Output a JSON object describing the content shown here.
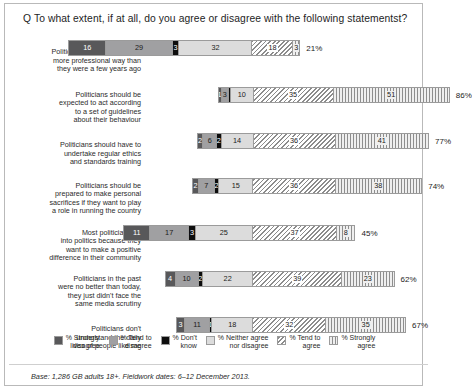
{
  "title": "Q To what extent, if at all, do you agree or disagree with the following statementst?",
  "footer": "Base: 1,286 GB adults 18+. Fieldwork dates: 6–12 December 2013.",
  "legend": [
    {
      "key": "strongly_disagree",
      "label": "% Strongly\ndisagree",
      "color": "#58585a"
    },
    {
      "key": "tend_to_disagree",
      "label": "% Tend to\ndisagree",
      "color": "#a0a0a2"
    },
    {
      "key": "dont_know",
      "label": "% Don't\nknow",
      "color": "#0d0d0d"
    },
    {
      "key": "neither",
      "label": "% Neither agree\nnor disagree",
      "color": "#dcdcdc"
    },
    {
      "key": "tend_to_agree",
      "label": "% Tend to\nagree",
      "color": "#ffffff"
    },
    {
      "key": "strongly_agree",
      "label": "% Strongly\nagree",
      "color": "#efefef"
    }
  ],
  "chart_data": {
    "type": "bar",
    "title": "Q To what extent, if at all, do you agree or disagree with the following statementst?",
    "subtype": "diverging-stacked-bar",
    "xlabel": "",
    "ylabel": "",
    "grid": false,
    "legend_position": "bottom",
    "series": [
      {
        "name": "% Strongly disagree",
        "values": [
          16,
          1,
          2,
          2,
          11,
          4,
          3
        ]
      },
      {
        "name": "% Tend to disagree",
        "values": [
          29,
          3,
          6,
          7,
          17,
          10,
          11
        ]
      },
      {
        "name": "% Don't know",
        "values": [
          3,
          1,
          2,
          2,
          3,
          2,
          1
        ]
      },
      {
        "name": "% Neither agree nor disagree",
        "values": [
          32,
          10,
          14,
          15,
          25,
          22,
          18
        ]
      },
      {
        "name": "% Tend to agree",
        "values": [
          18,
          35,
          36,
          36,
          37,
          39,
          32
        ]
      },
      {
        "name": "% Strongly agree",
        "values": [
          3,
          51,
          41,
          38,
          8,
          23,
          35
        ]
      }
    ],
    "categories": [
      "Politicians are behaving in a more professional way than they were a few years ago",
      "Politicians should be expected to act according to a set of guidelines about their behaviour",
      "Politicians should have to undertake regular ethics and standards training",
      "Politicians should be prepared to make personal sacrifices if they want to play a role in running the country",
      "Most politicians go into politics because they want to make a positive difference in their community",
      "Politicians in the past were no better than today, they just didn't face the same media scrutiny",
      "Politicians don't understand the daily lives of people like me"
    ],
    "net_agree_totals": [
      "21%",
      "86%",
      "77%",
      "74%",
      "45%",
      "62%",
      "67%"
    ]
  },
  "rows": [
    {
      "label": "Politicians are behaving in a\nmore professional way than\nthey were a few years ago",
      "total": "21%",
      "segments": [
        {
          "key": "strongly_disagree",
          "value": 16,
          "show": true
        },
        {
          "key": "tend_to_disagree",
          "value": 29,
          "show": true
        },
        {
          "key": "dont_know",
          "value": 3,
          "show": true
        },
        {
          "key": "neither",
          "value": 32,
          "show": true
        },
        {
          "key": "tend_to_agree",
          "value": 18,
          "show": true
        },
        {
          "key": "strongly_agree",
          "value": 3,
          "show": true
        }
      ]
    },
    {
      "label": "Politicians should be\nexpected to act according\nto a set of guidelines\nabout their behaviour",
      "total": "86%",
      "segments": [
        {
          "key": "strongly_disagree",
          "value": 1,
          "show": true
        },
        {
          "key": "tend_to_disagree",
          "value": 3,
          "show": true
        },
        {
          "key": "dont_know",
          "value": 1,
          "show": false
        },
        {
          "key": "neither",
          "value": 10,
          "show": true
        },
        {
          "key": "tend_to_agree",
          "value": 35,
          "show": true
        },
        {
          "key": "strongly_agree",
          "value": 51,
          "show": true
        }
      ]
    },
    {
      "label": "Politicians should have to\nundertake regular ethics\nand standards training",
      "total": "77%",
      "segments": [
        {
          "key": "strongly_disagree",
          "value": 2,
          "show": true
        },
        {
          "key": "tend_to_disagree",
          "value": 6,
          "show": true
        },
        {
          "key": "dont_know",
          "value": 2,
          "show": true
        },
        {
          "key": "neither",
          "value": 14,
          "show": true
        },
        {
          "key": "tend_to_agree",
          "value": 36,
          "show": true
        },
        {
          "key": "strongly_agree",
          "value": 41,
          "show": true
        }
      ]
    },
    {
      "label": "Politicians should be\nprepared to make personal\nsacrifices if they want to play\na role in running the country",
      "total": "74%",
      "segments": [
        {
          "key": "strongly_disagree",
          "value": 2,
          "show": true
        },
        {
          "key": "tend_to_disagree",
          "value": 7,
          "show": true
        },
        {
          "key": "dont_know",
          "value": 2,
          "show": true
        },
        {
          "key": "neither",
          "value": 15,
          "show": true
        },
        {
          "key": "tend_to_agree",
          "value": 36,
          "show": true
        },
        {
          "key": "strongly_agree",
          "value": 38,
          "show": true
        }
      ]
    },
    {
      "label": "Most politicians go\ninto politics because they\nwant to make a positive\ndifference in their community",
      "total": "45%",
      "segments": [
        {
          "key": "strongly_disagree",
          "value": 11,
          "show": true
        },
        {
          "key": "tend_to_disagree",
          "value": 17,
          "show": true
        },
        {
          "key": "dont_know",
          "value": 3,
          "show": true
        },
        {
          "key": "neither",
          "value": 25,
          "show": true
        },
        {
          "key": "tend_to_agree",
          "value": 37,
          "show": true
        },
        {
          "key": "strongly_agree",
          "value": 8,
          "show": true
        }
      ]
    },
    {
      "label": "Politicians in the past\nwere no better than today,\nthey just didn't face the\nsame media scrutiny",
      "total": "62%",
      "segments": [
        {
          "key": "strongly_disagree",
          "value": 4,
          "show": true
        },
        {
          "key": "tend_to_disagree",
          "value": 10,
          "show": true
        },
        {
          "key": "dont_know",
          "value": 2,
          "show": true
        },
        {
          "key": "neither",
          "value": 22,
          "show": true
        },
        {
          "key": "tend_to_agree",
          "value": 39,
          "show": true
        },
        {
          "key": "strongly_agree",
          "value": 23,
          "show": true
        }
      ]
    },
    {
      "label": "Politicians don't\nunderstand the daily\nlives of people like me",
      "total": "67%",
      "segments": [
        {
          "key": "strongly_disagree",
          "value": 3,
          "show": true
        },
        {
          "key": "tend_to_disagree",
          "value": 11,
          "show": true
        },
        {
          "key": "dont_know",
          "value": 1,
          "show": true
        },
        {
          "key": "neither",
          "value": 18,
          "show": true
        },
        {
          "key": "tend_to_agree",
          "value": 32,
          "show": true
        },
        {
          "key": "strongly_agree",
          "value": 35,
          "show": true
        }
      ]
    }
  ]
}
